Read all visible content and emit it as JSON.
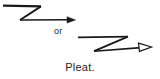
{
  "figure": {
    "type": "technical-sewing-symbol-diagram",
    "background_color": "#ffffff",
    "stroke_color": "#1a1a1a",
    "text_color": "#262626",
    "canvas": {
      "width": 160,
      "height": 79
    },
    "connector": {
      "text": "or",
      "name": "or-connector"
    },
    "caption": {
      "text": "Pleat.",
      "name": "figure-caption"
    },
    "symbols": [
      {
        "name": "pleat-symbol-solid-arrow",
        "description": "Z-shaped zigzag pleat symbol with solid filled arrowhead",
        "arrowhead_style": "solid",
        "points": [
          {
            "x": 3,
            "y": 6
          },
          {
            "x": 41,
            "y": 6
          },
          {
            "x": 20,
            "y": 20
          },
          {
            "x": 68,
            "y": 20
          }
        ],
        "arrow_tip": {
          "x": 75,
          "y": 20
        }
      },
      {
        "name": "pleat-symbol-open-arrow",
        "description": "Z-shaped zigzag pleat symbol with open outline arrowhead",
        "arrowhead_style": "open",
        "points": [
          {
            "x": 78,
            "y": 37
          },
          {
            "x": 128,
            "y": 37
          },
          {
            "x": 94,
            "y": 51
          },
          {
            "x": 139,
            "y": 49
          }
        ],
        "arrow_tip": {
          "x": 152,
          "y": 47
        }
      }
    ]
  }
}
